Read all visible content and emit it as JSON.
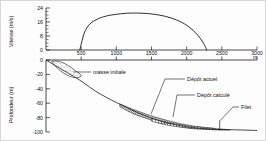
{
  "figure": {
    "caption_present": false
  },
  "velocity_panel": {
    "ylabel": "Vitesse (m/s)",
    "yticks": [
      "0",
      "8",
      "16",
      "24"
    ],
    "xunit": "m"
  },
  "depth_panel": {
    "ylabel": "Profondeur (m)",
    "yticks": [
      "0",
      "-20",
      "-40",
      "-60",
      "-80",
      "-100"
    ],
    "xticks": [
      "500",
      "1000",
      "1500",
      "2000",
      "2500",
      "3000"
    ],
    "xunit": "m"
  },
  "annotations": {
    "initial_mass": "masse initiale",
    "actual_deposit": "Dépôt actuel",
    "computed_deposit": "Dépôt calculé",
    "net": "Filet"
  },
  "chart_data": [
    {
      "type": "line",
      "id": "velocity-profile",
      "title": "",
      "xlabel": "m",
      "ylabel": "Vitesse (m/s)",
      "xlim": [
        0,
        3000
      ],
      "ylim": [
        0,
        24
      ],
      "yticks": [
        0,
        8,
        16,
        24
      ],
      "xticks": [
        500,
        1000,
        1500,
        2000,
        2500,
        3000
      ],
      "grid": false,
      "legend": null,
      "series": [
        {
          "name": "Vitesse",
          "x": [
            480,
            500,
            530,
            560,
            600,
            650,
            700,
            760,
            820,
            900,
            980,
            1060,
            1140,
            1220,
            1300,
            1380,
            1460,
            1540,
            1620,
            1700,
            1780,
            1860,
            1940,
            2020,
            2090,
            2150,
            2200,
            2240,
            2270,
            2285
          ],
          "y": [
            0,
            3.2,
            8.0,
            11.2,
            13.8,
            15.8,
            17.0,
            18.2,
            19.0,
            19.8,
            20.3,
            20.7,
            21.0,
            21.1,
            21.1,
            21.0,
            20.8,
            20.4,
            19.9,
            19.2,
            18.3,
            17.1,
            15.6,
            13.6,
            11.3,
            8.8,
            6.4,
            3.8,
            1.4,
            0
          ]
        }
      ]
    },
    {
      "type": "line",
      "id": "bathymetric-section",
      "title": "",
      "xlabel": "m",
      "ylabel": "Profondeur (m)",
      "xlim": [
        0,
        3000
      ],
      "ylim": [
        -100,
        0
      ],
      "yticks": [
        0,
        -20,
        -40,
        -60,
        -80,
        -100
      ],
      "xticks": [
        500,
        1000,
        1500,
        2000,
        2500,
        3000
      ],
      "grid": false,
      "series": [
        {
          "name": "Fond marin",
          "x": [
            0,
            120,
            260,
            400,
            540,
            700,
            860,
            1000,
            1150,
            1300,
            1450,
            1600,
            1750,
            1900,
            2050,
            2200,
            2350,
            2500,
            2700,
            2900,
            3000
          ],
          "y": [
            0,
            -7,
            -15,
            -23,
            -32,
            -43,
            -52,
            -59,
            -66,
            -73,
            -79,
            -84,
            -88,
            -91,
            -93.5,
            -95,
            -96,
            -96.5,
            -97,
            -97.5,
            -98
          ]
        },
        {
          "name": "masse initiale",
          "x": [
            80,
            140,
            220,
            320,
            420,
            500,
            470,
            380,
            280,
            180,
            110,
            80
          ],
          "y": [
            -2,
            -1.5,
            -3,
            -8,
            -15,
            -21,
            -24,
            -24,
            -20,
            -13,
            -6,
            -2
          ]
        },
        {
          "name": "Dépôt actuel",
          "x": [
            1050,
            1250,
            1450,
            1650,
            1850,
            2050,
            2250,
            2400,
            2250,
            2050,
            1850,
            1650,
            1450,
            1250,
            1050
          ],
          "y": [
            -61,
            -69,
            -76,
            -82,
            -87,
            -91,
            -93.5,
            -95,
            -96,
            -95,
            -92,
            -88,
            -82,
            -75,
            -65
          ]
        },
        {
          "name": "Dépôt calculé",
          "x": [
            1500,
            1700,
            1900,
            2100,
            2300,
            2500,
            2620,
            2500,
            2300,
            2100,
            1900,
            1700,
            1500
          ],
          "y": [
            -81,
            -86,
            -90,
            -92.5,
            -94.5,
            -96,
            -97,
            -97.5,
            -96.5,
            -95,
            -93,
            -90,
            -85
          ]
        }
      ],
      "markers": [
        {
          "name": "Filet",
          "x": 2470,
          "y": -96.5,
          "height": 9
        }
      ]
    }
  ]
}
